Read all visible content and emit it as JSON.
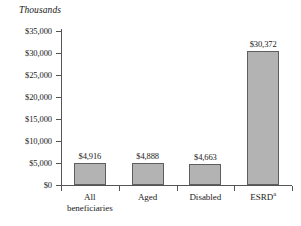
{
  "chart_data": {
    "type": "bar",
    "title": "",
    "subtitle": "",
    "unit_caption": "Thousands",
    "xlabel": "",
    "ylabel": "",
    "ylim": [
      0,
      35000
    ],
    "grid": false,
    "legend": false,
    "categories": [
      "All beneficiaries",
      "Aged",
      "Disabled",
      "ESRD"
    ],
    "category_lines": [
      [
        "All",
        "beneficiaries"
      ],
      [
        "Aged"
      ],
      [
        "Disabled"
      ],
      [
        "ESRD"
      ]
    ],
    "category_footnotes": [
      "",
      "",
      "",
      "a"
    ],
    "values": [
      4916,
      4888,
      4663,
      30372
    ],
    "value_labels": [
      "$4,916",
      "$4,888",
      "$4,663",
      "$30,372"
    ],
    "ytick_values": [
      0,
      5000,
      10000,
      15000,
      20000,
      25000,
      30000,
      35000
    ],
    "ytick_labels": [
      "$0",
      "$5,000",
      "$10,000",
      "$15,000",
      "$20,000",
      "$25,000",
      "$30,000",
      "$35,000"
    ],
    "colors": {
      "bar_fill": "#b3b3b3",
      "bar_stroke": "#5e5e5e",
      "axis": "#555555",
      "text": "#1a1a1a",
      "background": "#ffffff"
    }
  }
}
